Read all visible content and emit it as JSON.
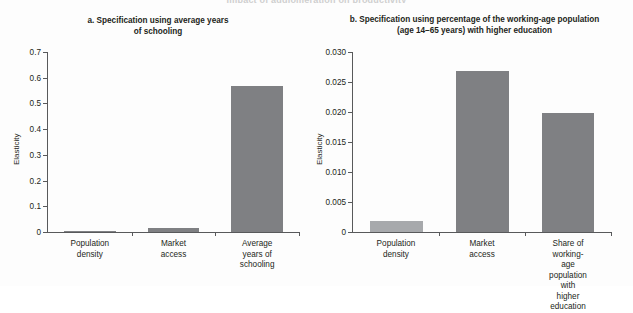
{
  "figure": {
    "cut_off_header": "Impact of agglomeration on productivity"
  },
  "chart_data": [
    {
      "type": "bar",
      "panel_id": "a",
      "title": "a. Specification using average years of schooling",
      "title_line1": "a. Specification using average years",
      "title_line2": "of schooling",
      "xlabel": "",
      "ylabel": "Elasticity",
      "ylim": [
        0,
        0.7
      ],
      "ytick_labels": [
        "0.7",
        "0.6",
        "0.5",
        "0.4",
        "0.3",
        "0.2",
        "0.1",
        "0"
      ],
      "ytick_values": [
        0.7,
        0.6,
        0.5,
        0.4,
        0.3,
        0.2,
        0.1,
        0
      ],
      "grid": false,
      "legend": "none",
      "categories": [
        "Population density",
        "Market access",
        "Average years of schooling"
      ],
      "category_lines": [
        [
          "Population",
          "density"
        ],
        [
          "Market",
          "access"
        ],
        [
          "Average years of",
          "schooling"
        ]
      ],
      "values": [
        0.004,
        0.016,
        0.569
      ],
      "bar_color": "#7f8083"
    },
    {
      "type": "bar",
      "panel_id": "b",
      "title": "b. Specification using percentage of the working-age population (age 14–65 years) with higher education",
      "title_line1": "b. Specification using percentage of the working-age population",
      "title_line2": "(age 14–65 years) with higher education",
      "xlabel": "",
      "ylabel": "Elasticity",
      "ylim": [
        0,
        0.03
      ],
      "ytick_labels": [
        "0.030",
        "0.025",
        "0.020",
        "0.015",
        "0.010",
        "0.005",
        "0"
      ],
      "ytick_values": [
        0.03,
        0.025,
        0.02,
        0.015,
        0.01,
        0.005,
        0
      ],
      "grid": false,
      "legend": "none",
      "categories": [
        "Population density",
        "Market access",
        "Share of working-age population with higher education"
      ],
      "category_lines": [
        [
          "Population",
          "density"
        ],
        [
          "Market",
          "access"
        ],
        [
          "Share of working-age",
          "population with",
          "higher education"
        ]
      ],
      "values": [
        0.0019,
        0.0269,
        0.0198
      ],
      "bar_color": "#7f8083"
    }
  ]
}
